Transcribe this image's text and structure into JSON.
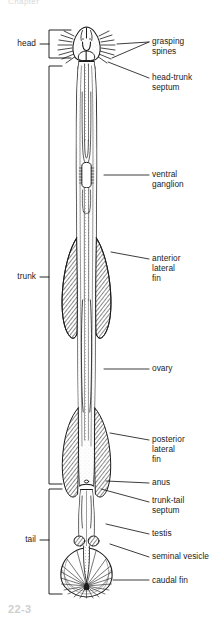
{
  "figure": {
    "title_fragment_top": "Chapter",
    "caption_fragment_bottom": "22-3",
    "organism": "arrow worm (chaetognath) whole-body ventral view",
    "ink_color": "#1b1b1b",
    "paper_color": "#ffffff",
    "fin_fill_color": "#9a9a9a"
  },
  "region_labels": [
    {
      "name": "head",
      "text": "head",
      "x": 12,
      "y": 43,
      "bracket_top": 30,
      "bracket_bottom": 58,
      "bracket_x": 49,
      "tick_y": 44
    },
    {
      "name": "trunk",
      "text": "trunk",
      "x": 10,
      "y": 272,
      "bracket_top": 66,
      "bracket_bottom": 484,
      "bracket_x": 49,
      "tick_y": 277
    },
    {
      "name": "tail",
      "text": "tail",
      "x": 17,
      "y": 535,
      "bracket_top": 489,
      "bracket_bottom": 594,
      "bracket_x": 49,
      "tick_y": 540
    }
  ],
  "part_labels": [
    {
      "name": "grasping-spines",
      "text": "grasping\nspines",
      "x": 152,
      "y": 36,
      "leader": [
        [
          150,
          41
        ],
        [
          117,
          44
        ],
        [
          150,
          41
        ],
        [
          112,
          57
        ]
      ]
    },
    {
      "name": "head-trunk-septum",
      "text": "head-trunk\nseptum",
      "x": 152,
      "y": 72,
      "leader": [
        [
          150,
          77
        ],
        [
          108,
          62
        ]
      ]
    },
    {
      "name": "ventral-ganglion",
      "text": "ventral\nganglion",
      "x": 152,
      "y": 169,
      "leader": [
        [
          150,
          174
        ],
        [
          104,
          174
        ]
      ]
    },
    {
      "name": "anterior-lateral-fin",
      "text": "anterior\nlateral\nfin",
      "x": 152,
      "y": 254,
      "leader": [
        [
          150,
          259
        ],
        [
          112,
          252
        ]
      ]
    },
    {
      "name": "ovary",
      "text": "ovary",
      "x": 152,
      "y": 363,
      "leader": [
        [
          150,
          368
        ],
        [
          106,
          368
        ]
      ]
    },
    {
      "name": "posterior-lateral-fin",
      "text": "posterior\nlateral\nfin",
      "x": 152,
      "y": 435,
      "leader": [
        [
          150,
          440
        ],
        [
          110,
          433
        ]
      ]
    },
    {
      "name": "anus",
      "text": "anus",
      "x": 152,
      "y": 478,
      "leader": [
        [
          150,
          483
        ],
        [
          108,
          480
        ]
      ]
    },
    {
      "name": "trunk-tail-septum",
      "text": "trunk-tail\nseptum",
      "x": 152,
      "y": 496,
      "leader": [
        [
          150,
          501
        ],
        [
          104,
          489
        ]
      ]
    },
    {
      "name": "testis",
      "text": "testis",
      "x": 152,
      "y": 529,
      "leader": [
        [
          150,
          534
        ],
        [
          109,
          525
        ]
      ]
    },
    {
      "name": "seminal-vesicle",
      "text": "seminal vesicle",
      "x": 152,
      "y": 551,
      "leader": [
        [
          150,
          556
        ],
        [
          111,
          541
        ]
      ]
    },
    {
      "name": "caudal-fin",
      "text": "caudal fin",
      "x": 152,
      "y": 575,
      "leader": [
        [
          150,
          580
        ],
        [
          112,
          580
        ]
      ]
    }
  ]
}
